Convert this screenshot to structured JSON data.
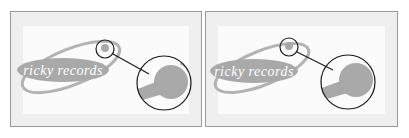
{
  "panels": [
    {
      "id": "left",
      "logo_text": "ricky records"
    },
    {
      "id": "right",
      "logo_text": "ricky records"
    }
  ],
  "colors": {
    "logo_fill": "#a9a9a9",
    "logo_text": "#ffffff",
    "outline": "#1a1a1a",
    "panel_border": "#9a9a9a",
    "panel_margin": "#efefef"
  }
}
